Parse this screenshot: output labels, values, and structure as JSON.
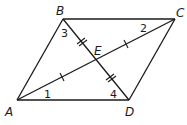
{
  "diagram": {
    "type": "parallelogram-with-diagonals",
    "points": {
      "A": {
        "label": "A",
        "x": 17,
        "y": 100
      },
      "B": {
        "label": "B",
        "x": 63,
        "y": 19
      },
      "C": {
        "label": "C",
        "x": 175,
        "y": 19
      },
      "D": {
        "label": "D",
        "x": 129,
        "y": 100
      },
      "E": {
        "label": "E",
        "x": 96,
        "y": 60
      }
    },
    "angle_labels": {
      "a1": "1",
      "a2": "2",
      "a3": "3",
      "a4": "4"
    },
    "segments": [
      "AB",
      "BC",
      "CD",
      "DA",
      "AC",
      "BD"
    ],
    "congruence_marks": {
      "AE_CE": "single tick",
      "BE_DE": "double tick"
    }
  }
}
